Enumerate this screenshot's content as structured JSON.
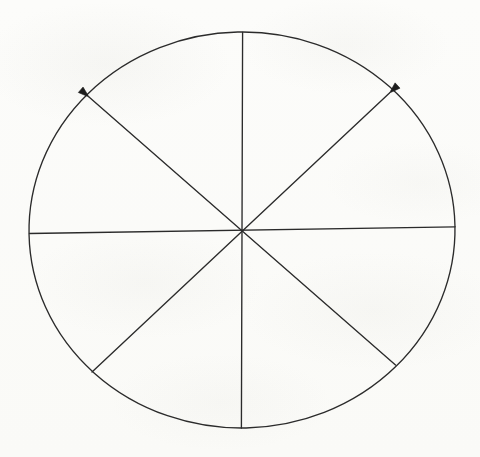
{
  "document": {
    "kind": "scanned-hand-drawn-geometry-figure",
    "background_color": "#fbfbf9",
    "ink_color": "#262626",
    "caption": "",
    "labels": []
  },
  "chart_data": {
    "type": "diagram",
    "title": "",
    "subtitle": "",
    "xlabel": "",
    "ylabel": "",
    "grid": false,
    "legend": null,
    "annotations": [],
    "tick_labels": [],
    "canvas": {
      "width": 480,
      "height": 457
    },
    "circle": {
      "name": "outer-circle",
      "center_x": 242,
      "center_y": 230,
      "radius_x": 213,
      "radius_y": 198,
      "rotation_deg": -1.2,
      "stroke": "#2b2b2b",
      "stroke_width": 1.35,
      "fill": "none"
    },
    "diameters": [
      {
        "name": "vertical-diameter",
        "angle_deg": 90,
        "x1": 242.6,
        "y1": 32.5,
        "x2": 241.4,
        "y2": 428.0,
        "arrow_start": false,
        "arrow_end": false
      },
      {
        "name": "horizontal-diameter",
        "angle_deg": 0,
        "x1": 29.5,
        "y1": 233.5,
        "x2": 455.0,
        "y2": 226.8,
        "arrow_start": false,
        "arrow_end": false
      },
      {
        "name": "diagonal-diameter-nw-se",
        "angle_deg": 135,
        "x1": 89.0,
        "y1": 97.0,
        "x2": 395.5,
        "y2": 365.0,
        "arrow_start": true,
        "arrow_end": false
      },
      {
        "name": "diagonal-diameter-ne-sw",
        "angle_deg": 45,
        "x1": 389.5,
        "y1": 93.0,
        "x2": 92.0,
        "y2": 372.0,
        "arrow_start": true,
        "arrow_end": false
      }
    ],
    "arrowheads": [
      {
        "name": "arrowhead-upper-left",
        "tip_x": 89.0,
        "tip_y": 97.0,
        "direction_deg": 221,
        "length": 11,
        "half_width": 3.6,
        "fill": "#1d1d1d"
      },
      {
        "name": "arrowhead-upper-right",
        "tip_x": 389.5,
        "tip_y": 93.0,
        "direction_deg": 317,
        "length": 11,
        "half_width": 3.6,
        "fill": "#1d1d1d"
      }
    ],
    "sectors_count": 8,
    "sector_angle_deg": 45
  }
}
